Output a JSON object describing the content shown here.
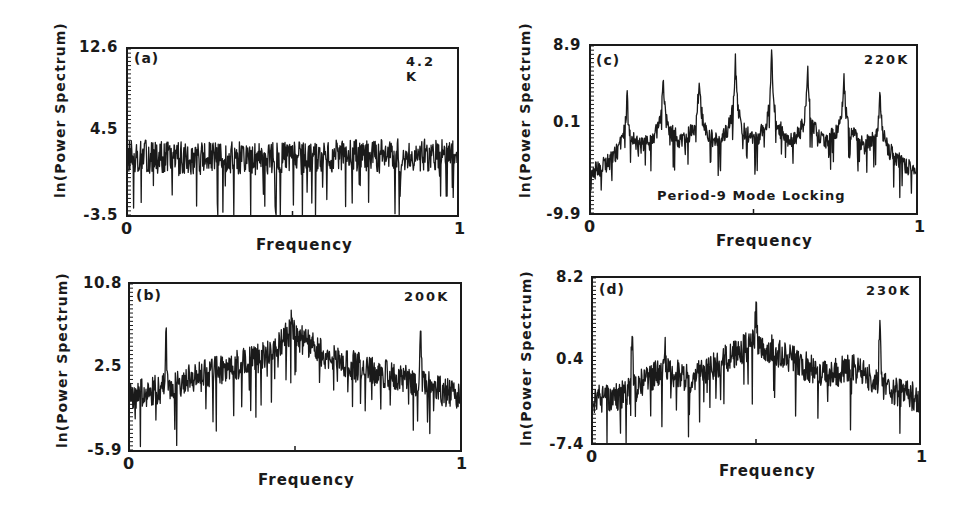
{
  "chart_data": [
    {
      "id": "a",
      "type": "line",
      "panel_label": "(a)",
      "temperature": "4.2 K",
      "title": "",
      "xlabel": "Frequency",
      "ylabel": "ln(Power Spectrum)",
      "xlim": [
        0,
        1
      ],
      "ylim": [
        -3.5,
        12.6
      ],
      "yticks": [
        "12.6",
        "4.5",
        "-3.5"
      ],
      "xticks": [
        "0",
        "1"
      ],
      "grid": false,
      "description": "Broadband flat noise spectrum",
      "envelope": {
        "x": [
          0,
          0.25,
          0.5,
          0.75,
          1.0
        ],
        "y": [
          2.2,
          2.0,
          2.0,
          2.3,
          2.3
        ]
      },
      "noise_amplitude": 1.6,
      "peaks": []
    },
    {
      "id": "b",
      "type": "line",
      "panel_label": "(b)",
      "temperature": "200K",
      "title": "",
      "xlabel": "Frequency",
      "ylabel": "ln(Power Spectrum)",
      "xlim": [
        0,
        1
      ],
      "ylim": [
        -5.9,
        10.8
      ],
      "yticks": [
        "10.8",
        "2.5",
        "-5.9"
      ],
      "xticks": [
        "0",
        "1"
      ],
      "grid": false,
      "description": "Broadband spectrum with central hump and sharp peaks near 0.11 and 0.88",
      "envelope": {
        "x": [
          0,
          0.1,
          0.2,
          0.3,
          0.4,
          0.49,
          0.6,
          0.7,
          0.8,
          0.9,
          1.0
        ],
        "y": [
          -0.5,
          0.3,
          1.6,
          2.4,
          3.4,
          6.0,
          3.4,
          2.4,
          1.6,
          0.6,
          -0.6
        ]
      },
      "noise_amplitude": 1.5,
      "peaks": [
        {
          "x": 0.11,
          "y": 6.3
        },
        {
          "x": 0.49,
          "y": 8.2
        },
        {
          "x": 0.88,
          "y": 6.6
        }
      ]
    },
    {
      "id": "c",
      "type": "line",
      "panel_label": "(c)",
      "temperature": "220K",
      "title": "",
      "annotation": "Period-9 Mode Locking",
      "xlabel": "Frequency",
      "ylabel": "ln(Power Spectrum)",
      "xlim": [
        0,
        1
      ],
      "ylim": [
        -9.9,
        8.9
      ],
      "yticks": [
        "8.9",
        "0.1",
        "-9.9"
      ],
      "xticks": [
        "0",
        "1"
      ],
      "grid": false,
      "description": "Sharp peaks at multiples of 1/9",
      "envelope": {
        "x": [
          0,
          0.1,
          0.2,
          0.3,
          0.5,
          0.7,
          0.8,
          0.9,
          1.0
        ],
        "y": [
          -6.0,
          -4.2,
          -3.2,
          -3.4,
          -3.6,
          -3.4,
          -3.2,
          -4.3,
          -5.8
        ]
      },
      "noise_amplitude": 1.0,
      "peaks": [
        {
          "x": 0.111,
          "y": 2.9
        },
        {
          "x": 0.222,
          "y": 5.1
        },
        {
          "x": 0.333,
          "y": 5.5
        },
        {
          "x": 0.444,
          "y": 7.7
        },
        {
          "x": 0.556,
          "y": 7.7
        },
        {
          "x": 0.667,
          "y": 5.7
        },
        {
          "x": 0.778,
          "y": 5.5
        },
        {
          "x": 0.889,
          "y": 3.2
        }
      ]
    },
    {
      "id": "d",
      "type": "line",
      "panel_label": "(d)",
      "temperature": "230K",
      "title": "",
      "xlabel": "Frequency",
      "ylabel": "ln(Power Spectrum)",
      "xlim": [
        0,
        1
      ],
      "ylim": [
        -7.4,
        8.2
      ],
      "yticks": [
        "8.2",
        "0.4",
        "-7.4"
      ],
      "xticks": [
        "0",
        "1"
      ],
      "grid": false,
      "description": "Broadband spectrum with central hump and sharp peaks near 0.12 and 0.88",
      "envelope": {
        "x": [
          0,
          0.1,
          0.2,
          0.3,
          0.4,
          0.5,
          0.6,
          0.7,
          0.8,
          0.9,
          1.0
        ],
        "y": [
          -3.4,
          -2.8,
          -0.6,
          -1.2,
          0.4,
          2.2,
          0.6,
          -0.8,
          -0.4,
          -2.2,
          -3.2
        ]
      },
      "noise_amplitude": 1.4,
      "peaks": [
        {
          "x": 0.12,
          "y": 3.5
        },
        {
          "x": 0.22,
          "y": 1.8
        },
        {
          "x": 0.5,
          "y": 5.0
        },
        {
          "x": 0.88,
          "y": 3.9
        }
      ]
    }
  ]
}
